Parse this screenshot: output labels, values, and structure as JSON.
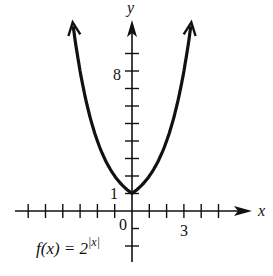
{
  "chart_data": {
    "type": "line",
    "title": "",
    "function_label": "f(x) = 2^|x|",
    "function_label_parts": {
      "base": "f(x) = 2",
      "exponent": "|x|"
    },
    "xlabel": "x",
    "ylabel": "y",
    "x_tick_labels": [
      {
        "value": 0,
        "label": "0"
      },
      {
        "value": 3,
        "label": "3"
      }
    ],
    "y_tick_labels": [
      {
        "value": 1,
        "label": "1"
      },
      {
        "value": 8,
        "label": "8"
      }
    ],
    "x_ticks": [
      -6,
      -5,
      -4,
      -3,
      -2,
      -1,
      1,
      2,
      3,
      4,
      5
    ],
    "y_ticks": [
      -2,
      -1,
      1,
      2,
      3,
      4,
      5,
      6,
      7,
      8,
      9
    ],
    "xlim": [
      -6.8,
      6.8
    ],
    "ylim": [
      -3,
      11
    ],
    "grid": false,
    "series": [
      {
        "name": "f(x) = 2^|x|",
        "x": [
          -3.4,
          -3,
          -2.5,
          -2,
          -1.5,
          -1,
          -0.5,
          0,
          0.5,
          1,
          1.5,
          2,
          2.5,
          3,
          3.4
        ],
        "y": [
          10.56,
          8,
          5.66,
          4,
          2.83,
          2,
          1.41,
          1,
          1.41,
          2,
          2.83,
          4,
          5.66,
          8,
          10.56
        ]
      }
    ],
    "annotations": [
      "arrows at both ends of curve",
      "y-intercept point (0,1)"
    ],
    "color": "#111111"
  },
  "labels": {
    "x_axis": "x",
    "y_axis": "y",
    "origin": "0",
    "x_three": "3",
    "y_one": "1",
    "y_eight": "8",
    "func_base": "f(x) = 2",
    "func_exp": "|x|"
  }
}
